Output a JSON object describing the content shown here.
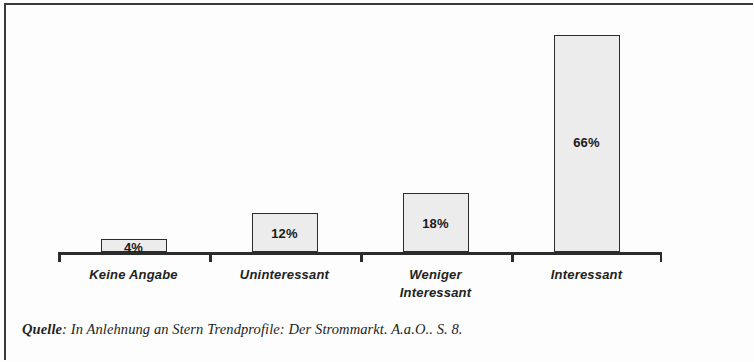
{
  "figure": {
    "border_color": "#3a3a3a",
    "background_color": "#fdfdfd"
  },
  "source": {
    "label": "Quelle",
    "text": ": In Anlehnung an Stern Trendprofile: Der Strommarkt. A.a.O.. S. 8."
  },
  "chart_data": {
    "type": "bar",
    "title": "",
    "subtitle": "",
    "xlabel": "",
    "ylabel": "",
    "ylim": [
      0,
      70
    ],
    "grid": false,
    "legend": "none",
    "orientation": "vertical",
    "value_label_position": "inside",
    "bar_fill": "#ececec",
    "bar_border": "#2b2b2b",
    "categories": [
      "Keine Angabe",
      "Uninteressant",
      "Weniger\nInteressant",
      "Interessant"
    ],
    "category_lines": [
      [
        "Keine Angabe"
      ],
      [
        "Uninteressant"
      ],
      [
        "Weniger",
        "Interessant"
      ],
      [
        "Interessant"
      ]
    ],
    "values": [
      4,
      12,
      18,
      66
    ],
    "value_labels": [
      "4%",
      "12%",
      "18%",
      "66%"
    ],
    "axis": {
      "baseline": true,
      "tick_positions": [
        0,
        1,
        2,
        3,
        4
      ],
      "tick_direction": "down"
    }
  }
}
